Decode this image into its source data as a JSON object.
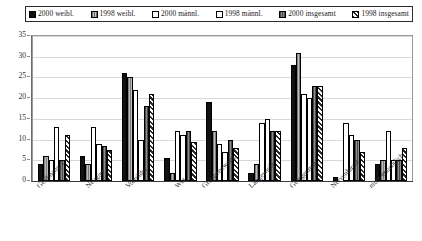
{
  "chart_data": {
    "type": "bar",
    "title": "",
    "subtitle": "",
    "xlabel": "",
    "ylabel": "",
    "ylim": [
      0,
      35
    ],
    "ytick_step": 5,
    "yticks": [
      35,
      30,
      25,
      20,
      15,
      10,
      5,
      0
    ],
    "grid": true,
    "legend_position": "top",
    "categories": [
      "Geldmangel",
      "Neugier",
      "Vorbilder",
      "Wut",
      "Gruppenzwang",
      "Langeweile",
      "Gelegenheit",
      "Nervenkitzel",
      "nicht ersichtlich"
    ],
    "series": [
      {
        "name": "2000 weibl.",
        "values": [
          4,
          6,
          26,
          5.5,
          19,
          2,
          28,
          1,
          4
        ]
      },
      {
        "name": "1998 weibl.",
        "values": [
          6,
          4,
          25,
          2,
          12,
          4,
          31,
          0,
          5
        ]
      },
      {
        "name": "2000 männl.",
        "values": [
          5,
          13,
          22,
          12,
          9,
          14,
          21,
          14,
          12
        ]
      },
      {
        "name": "1998 männl.",
        "values": [
          13,
          9,
          10,
          11,
          7,
          15,
          20,
          11,
          5
        ]
      },
      {
        "name": "2000 insgesamt",
        "values": [
          5,
          8.5,
          18,
          12,
          10,
          12,
          23,
          10,
          5
        ]
      },
      {
        "name": "1998 insgesamt",
        "values": [
          11,
          7.5,
          21,
          9.5,
          8,
          12,
          23,
          7,
          8
        ]
      }
    ]
  },
  "legend": {
    "items": [
      {
        "label": "2000 weibl.",
        "swatch": "solid-black-swatch"
      },
      {
        "label": "1998 weibl.",
        "swatch": "light-grey-swatch"
      },
      {
        "label": "2000 männl.",
        "swatch": "white-swatch"
      },
      {
        "label": "1998 männl.",
        "swatch": "white-swatch"
      },
      {
        "label": "2000 insgesamt",
        "swatch": "dark-grey-swatch"
      },
      {
        "label": "1998 insgesamt",
        "swatch": "diagonal-hatch-swatch"
      }
    ]
  }
}
